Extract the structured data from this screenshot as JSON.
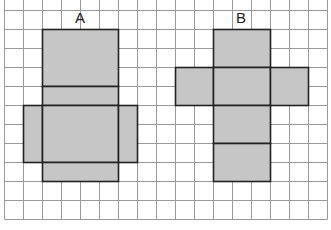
{
  "colors": {
    "background": "#ffffff",
    "grid_line": "#9a9a9a",
    "shape_fill": "#c6c6c6",
    "shape_stroke": "#222222"
  },
  "grid": {
    "origin_x": 4,
    "origin_y": 10,
    "cell": 19,
    "cols": 17,
    "rows": 11
  },
  "labels": [
    {
      "id": "A",
      "text": "A",
      "x": 80,
      "y": 19
    },
    {
      "id": "B",
      "text": "B",
      "x": 241,
      "y": 19
    }
  ],
  "nets": [
    {
      "name": "A",
      "faces": [
        {
          "col": 2,
          "row": 1,
          "w": 4,
          "h": 3
        },
        {
          "col": 2,
          "row": 4,
          "w": 4,
          "h": 1
        },
        {
          "col": 1,
          "row": 5,
          "w": 1,
          "h": 3
        },
        {
          "col": 2,
          "row": 5,
          "w": 4,
          "h": 3
        },
        {
          "col": 6,
          "row": 5,
          "w": 1,
          "h": 3
        },
        {
          "col": 2,
          "row": 8,
          "w": 4,
          "h": 1
        }
      ]
    },
    {
      "name": "B",
      "faces": [
        {
          "col": 11,
          "row": 1,
          "w": 3,
          "h": 2
        },
        {
          "col": 9,
          "row": 3,
          "w": 2,
          "h": 2
        },
        {
          "col": 11,
          "row": 3,
          "w": 3,
          "h": 2
        },
        {
          "col": 14,
          "row": 3,
          "w": 2,
          "h": 2
        },
        {
          "col": 11,
          "row": 5,
          "w": 3,
          "h": 2
        },
        {
          "col": 11,
          "row": 7,
          "w": 3,
          "h": 2
        }
      ]
    }
  ]
}
